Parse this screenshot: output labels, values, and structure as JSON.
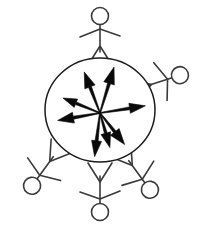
{
  "figure": {
    "description": "A central ellipse with eight bold arrows radiating outward from the centre, surrounded by five stick figures arranged radially around the ellipse.",
    "background_color": "#ffffff",
    "stroke_color": "#3a3a3a",
    "arrow_color": "#0a0a0a",
    "boundary_color": "#1c1c1c"
  },
  "boundary": {
    "name": "central-ellipse",
    "center_x": 100,
    "center_y": 110,
    "radius_x": 55,
    "radius_y": 52,
    "stroke_width": 1.5
  },
  "arrows": {
    "count": 8,
    "origin_x": 100,
    "origin_y": 113,
    "items": [
      {
        "label": "arrow-up-left-steep",
        "angle_deg": 249,
        "length": 44,
        "head_length": 16,
        "head_width": 11,
        "tail_width": 1.4
      },
      {
        "label": "arrow-up-right-steep",
        "angle_deg": 287,
        "length": 48,
        "head_length": 17,
        "head_width": 11,
        "tail_width": 1.4
      },
      {
        "label": "arrow-left-upper",
        "angle_deg": 202,
        "length": 40,
        "head_length": 14,
        "head_width": 9,
        "tail_width": 1.3
      },
      {
        "label": "arrow-right",
        "angle_deg": 351,
        "length": 46,
        "head_length": 16,
        "head_width": 10,
        "tail_width": 1.3
      },
      {
        "label": "arrow-left-lower",
        "angle_deg": 170,
        "length": 43,
        "head_length": 16,
        "head_width": 11,
        "tail_width": 1.4
      },
      {
        "label": "arrow-down",
        "angle_deg": 97,
        "length": 44,
        "head_length": 16,
        "head_width": 10,
        "tail_width": 1.4
      },
      {
        "label": "arrow-down-right-near",
        "angle_deg": 74,
        "length": 36,
        "head_length": 15,
        "head_width": 10,
        "tail_width": 1.3
      },
      {
        "label": "arrow-down-right-far",
        "angle_deg": 52,
        "length": 40,
        "head_length": 16,
        "head_width": 11,
        "tail_width": 1.4
      }
    ]
  },
  "figures": {
    "count": 5,
    "head_radius": 8.5,
    "items": [
      {
        "label": "stick-figure-top",
        "position": "top",
        "center_x": 100,
        "center_y": 38,
        "rotation_deg": 0,
        "head_cx": 100,
        "head_cy": 16
      },
      {
        "label": "stick-figure-upper-right",
        "position": "upper-right",
        "center_x": 159,
        "center_y": 82,
        "rotation_deg": 72,
        "head_cx": 180,
        "head_cy": 75
      },
      {
        "label": "stick-figure-lower-right",
        "position": "lower-right",
        "center_x": 137,
        "center_y": 172,
        "rotation_deg": 144,
        "head_cx": 155,
        "head_cy": 188
      },
      {
        "label": "stick-figure-bottom",
        "position": "bottom",
        "center_x": 100,
        "center_y": 190,
        "rotation_deg": 180,
        "head_cx": 100,
        "head_cy": 212
      },
      {
        "label": "stick-figure-lower-left",
        "position": "lower-left",
        "center_x": 45,
        "center_y": 168,
        "rotation_deg": 216,
        "head_cx": 24,
        "head_cy": 178
      }
    ]
  }
}
